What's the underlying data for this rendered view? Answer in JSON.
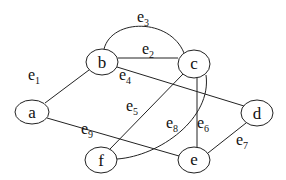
{
  "diagram": {
    "type": "graph",
    "nodes": [
      {
        "id": "a",
        "label": "a",
        "cx": 32,
        "cy": 112,
        "rx": 17,
        "ry": 12
      },
      {
        "id": "b",
        "label": "b",
        "cx": 102,
        "cy": 62,
        "rx": 16,
        "ry": 13
      },
      {
        "id": "c",
        "label": "c",
        "cx": 194,
        "cy": 64,
        "rx": 16,
        "ry": 14
      },
      {
        "id": "d",
        "label": "d",
        "cx": 257,
        "cy": 113,
        "rx": 16,
        "ry": 13
      },
      {
        "id": "e",
        "label": "e",
        "cx": 194,
        "cy": 160,
        "rx": 16,
        "ry": 13
      },
      {
        "id": "f",
        "label": "f",
        "cx": 101,
        "cy": 160,
        "rx": 16,
        "ry": 13
      }
    ],
    "edges": [
      {
        "id": "e1",
        "base": "e",
        "sub": "1",
        "from": "a",
        "to": "b",
        "lx": 52,
        "ly": 80
      },
      {
        "id": "e2",
        "base": "e",
        "sub": "2",
        "from": "b",
        "to": "c",
        "lx": 142,
        "ly": 53
      },
      {
        "id": "e3",
        "base": "e",
        "sub": "3",
        "from": "b",
        "to": "c",
        "lx": 139,
        "ly": 22
      },
      {
        "id": "e4",
        "base": "e",
        "sub": "4",
        "from": "b",
        "to": "d",
        "lx": 120,
        "ly": 80
      },
      {
        "id": "e5",
        "base": "e",
        "sub": "5",
        "from": "f",
        "to": "c",
        "lx": 127,
        "ly": 110
      },
      {
        "id": "e6",
        "base": "e",
        "sub": "6",
        "from": "c",
        "to": "e",
        "lx": 197,
        "ly": 128
      },
      {
        "id": "e7",
        "base": "e",
        "sub": "7",
        "from": "e",
        "to": "d",
        "lx": 236,
        "ly": 146
      },
      {
        "id": "e8",
        "base": "e",
        "sub": "8",
        "from": "f",
        "to": "c",
        "lx": 166,
        "ly": 128
      },
      {
        "id": "e9",
        "base": "e",
        "sub": "9",
        "from": "a",
        "to": "e",
        "lx": 81,
        "ly": 133
      }
    ]
  }
}
